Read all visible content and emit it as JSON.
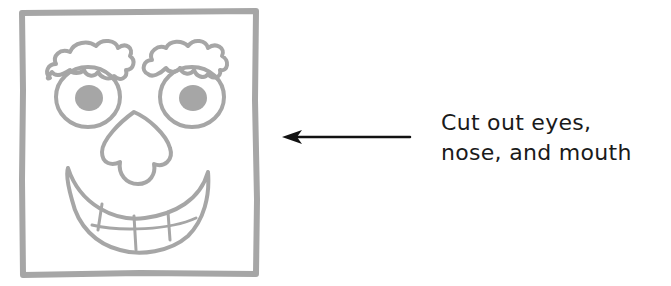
{
  "diagram": {
    "mask": {
      "label": "face mask template",
      "stroke_color": "#a6a6a6",
      "parts": [
        "frame",
        "left-eyebrow",
        "right-eyebrow",
        "left-eye",
        "right-eye",
        "nose",
        "mouth",
        "teeth"
      ]
    },
    "arrow": {
      "direction": "left",
      "color": "#111111"
    },
    "caption": {
      "line1": "Cut out eyes,",
      "line2": "nose, and mouth"
    }
  }
}
